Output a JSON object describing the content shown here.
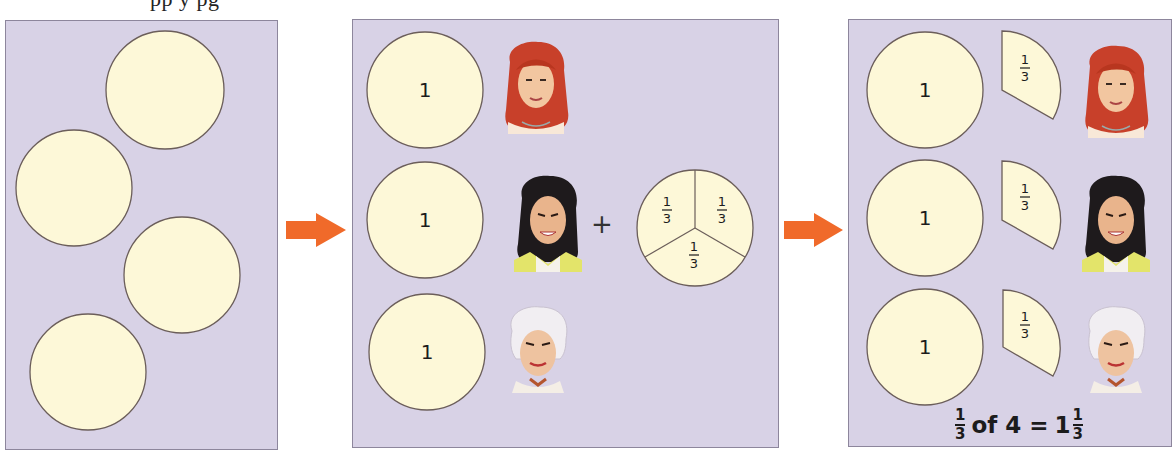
{
  "header_fragment": "pp   y  pg",
  "colors": {
    "panel_bg": "#d8d2e6",
    "panel_border": "#8d869c",
    "circle_fill": "#fdf8d8",
    "circle_stroke": "#6b5e5a",
    "arrow": "#f06a2a",
    "text": "#1c1c1c"
  },
  "panels": [
    {
      "id": "panel-1",
      "description": "Four whole cakes",
      "circles": 4
    },
    {
      "id": "panel-2",
      "description": "Three people each get one whole; the fourth is split into thirds",
      "whole_labels": [
        "1",
        "1",
        "1"
      ],
      "plus_sign": "+",
      "split_pie_labels": [
        {
          "num": "1",
          "den": "3"
        },
        {
          "num": "1",
          "den": "3"
        },
        {
          "num": "1",
          "den": "3"
        }
      ],
      "people": [
        "red-haired girl",
        "dark-haired woman",
        "white-haired man"
      ]
    },
    {
      "id": "panel-3",
      "description": "Each person gets one whole and one third",
      "whole_labels": [
        "1",
        "1",
        "1"
      ],
      "wedge_labels": [
        {
          "num": "1",
          "den": "3"
        },
        {
          "num": "1",
          "den": "3"
        },
        {
          "num": "1",
          "den": "3"
        }
      ],
      "caption": {
        "frac_num": "1",
        "frac_den": "3",
        "text": "of 4 =",
        "whole": "1",
        "result_num": "1",
        "result_den": "3"
      }
    }
  ]
}
